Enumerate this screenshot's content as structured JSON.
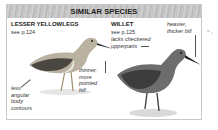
{
  "panel": {
    "title": "SIMILAR SPECIES"
  },
  "species": [
    {
      "name": "LESSER YELLOWLEGS",
      "ref": "see p.124",
      "notes": {
        "bill": [
          "thinner,",
          "more",
          "pointed",
          "bill"
        ],
        "body": [
          "less",
          "angular",
          "body",
          "contours"
        ]
      }
    },
    {
      "name": "WILLET",
      "ref": "see p.125",
      "notes": {
        "upperparts": [
          "lacks checkered",
          "upperparts"
        ],
        "bill": [
          "heavier,",
          "thicker bill"
        ]
      }
    }
  ],
  "colors": {
    "header_bg": "#c4c4c4",
    "border": "#c8c8c8",
    "text": "#222222"
  }
}
